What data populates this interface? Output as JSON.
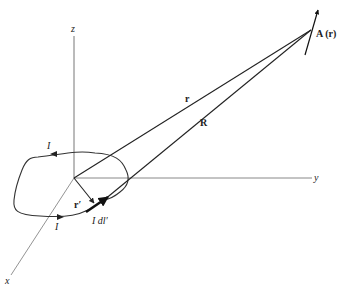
{
  "diagram": {
    "type": "vector-potential-geometry",
    "axes": {
      "x_label": "x",
      "y_label": "y",
      "z_label": "z"
    },
    "labels": {
      "field_point": "A (r)",
      "position_vector": "r",
      "separation_vector": "R",
      "source_position": "r′",
      "current_element": "I dl′",
      "current_top": "I",
      "current_bottom": "I"
    },
    "colors": {
      "line": "#222222",
      "axis": "#666666",
      "background": "#ffffff"
    }
  }
}
